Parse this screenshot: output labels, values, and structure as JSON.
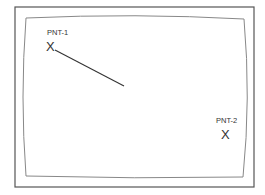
{
  "diagram": {
    "type": "point-plot-view",
    "frame": {
      "outer": {
        "x": 15,
        "y": 7,
        "w": 239,
        "h": 180,
        "stroke": "#555555"
      },
      "inner_curve_color": "#888888"
    },
    "points": [
      {
        "id": "pnt-1",
        "label": "PNT-1",
        "marker": "X",
        "x": 51,
        "y": 46,
        "label_x": 47,
        "label_y": 35
      },
      {
        "id": "pnt-2",
        "label": "PNT-2",
        "marker": "X",
        "x": 226,
        "y": 134,
        "label_x": 216,
        "label_y": 123
      }
    ],
    "line": {
      "x1": 55,
      "y1": 50,
      "x2": 124,
      "y2": 86,
      "stroke": "#333333"
    }
  }
}
